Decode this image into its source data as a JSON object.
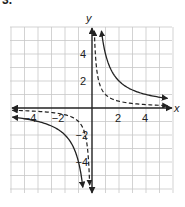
{
  "problem_number": "3.",
  "chart_data": {
    "type": "line",
    "title": "",
    "xlabel": "x",
    "ylabel": "y",
    "xlim": [
      -6,
      6
    ],
    "ylim": [
      -6,
      6
    ],
    "grid": true,
    "x_ticks": [
      "-4",
      "-2",
      "2",
      "4"
    ],
    "y_ticks": [
      "4",
      "2",
      "-2",
      "-4"
    ],
    "series": [
      {
        "name": "solid curve",
        "style": "solid",
        "equation": "y = 4/x",
        "points": [
          [
            -6,
            -0.67
          ],
          [
            -4,
            -1
          ],
          [
            -2,
            -2
          ],
          [
            -1,
            -4
          ],
          [
            -0.7,
            -5.7
          ],
          [
            0.7,
            5.7
          ],
          [
            1,
            4
          ],
          [
            2,
            2
          ],
          [
            4,
            1
          ],
          [
            5.5,
            0.73
          ]
        ]
      },
      {
        "name": "dashed curve",
        "style": "dashed",
        "equation": "y = 1/x",
        "points": [
          [
            -6,
            -0.17
          ],
          [
            -4,
            -0.25
          ],
          [
            -2,
            -0.5
          ],
          [
            -1,
            -1
          ],
          [
            -0.5,
            -2
          ],
          [
            -0.18,
            -5.7
          ],
          [
            0.18,
            5.7
          ],
          [
            0.5,
            2
          ],
          [
            1,
            1
          ],
          [
            2,
            0.5
          ],
          [
            4,
            0.25
          ],
          [
            5.5,
            0.18
          ]
        ]
      }
    ]
  },
  "labels": {
    "x_axis": "x",
    "y_axis": "y",
    "tick_x_neg4": "−4",
    "tick_x_neg2": "−2",
    "tick_x_2": "2",
    "tick_x_4": "4",
    "tick_y_4": "4",
    "tick_y_2": "2",
    "tick_y_neg2": "−2",
    "tick_y_neg4": "−4"
  }
}
